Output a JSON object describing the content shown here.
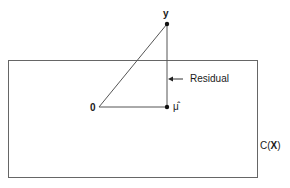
{
  "diagram": {
    "labels": {
      "y": "y",
      "origin": "0",
      "mu_hat": "μ̂",
      "residual": "Residual",
      "column_space_prefix": "C(",
      "column_space_var": "X",
      "column_space_suffix": ")"
    },
    "colors": {
      "line": "#555555",
      "point": "#111111",
      "text": "#1a1a1a"
    }
  }
}
